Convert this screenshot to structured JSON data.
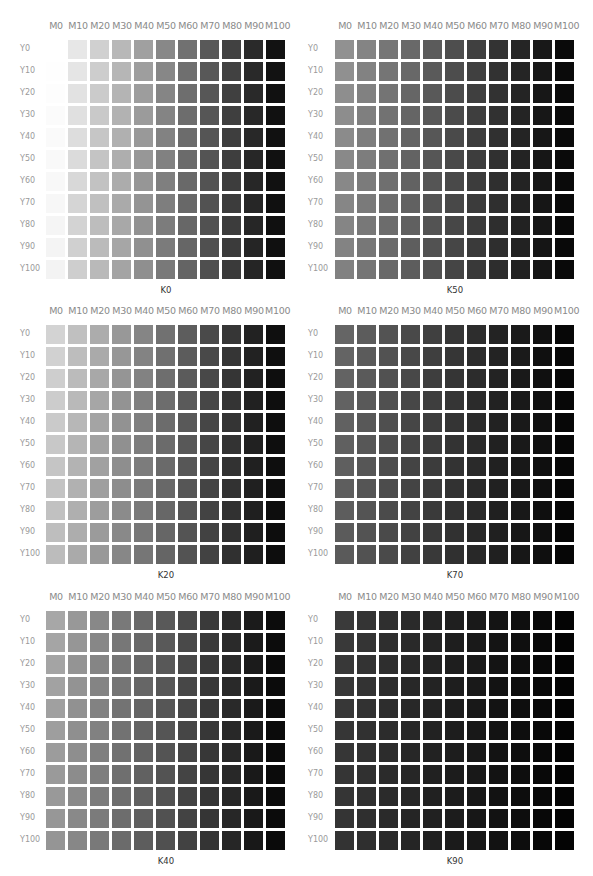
{
  "chart_data": {
    "type": "heatmap",
    "xlabel": "Magenta %",
    "ylabel": "Yellow %",
    "x_tick_labels": [
      "M0",
      "M10",
      "M20",
      "M30",
      "M40",
      "M50",
      "M60",
      "M70",
      "M80",
      "M90",
      "M100"
    ],
    "y_tick_labels": [
      "Y0",
      "Y10",
      "Y20",
      "Y30",
      "Y40",
      "Y50",
      "Y60",
      "Y70",
      "Y80",
      "Y90",
      "Y100"
    ],
    "panels": [
      {
        "label": "K0",
        "k": 0,
        "position": "top-left"
      },
      {
        "label": "K50",
        "k": 50,
        "position": "top-right"
      },
      {
        "label": "K20",
        "k": 20,
        "position": "middle-left"
      },
      {
        "label": "K70",
        "k": 70,
        "position": "middle-right"
      },
      {
        "label": "K40",
        "k": 40,
        "position": "bottom-left"
      },
      {
        "label": "K90",
        "k": 90,
        "position": "bottom-right"
      }
    ],
    "value_note": "Each cell shade = grayscale rendering of (M, Y, K); darkness increases with M strongly, Y slightly, K strongly",
    "legend": "none",
    "grid": false
  },
  "panels": [
    {
      "title": "K0",
      "x": 0,
      "y": 20,
      "k": 0
    },
    {
      "title": "K50",
      "x": 290,
      "y": 20,
      "k": 50
    },
    {
      "title": "K20",
      "x": 0,
      "y": 305,
      "k": 20
    },
    {
      "title": "K70",
      "x": 290,
      "y": 305,
      "k": 70
    },
    {
      "title": "K40",
      "x": 0,
      "y": 591,
      "k": 40
    },
    {
      "title": "K90",
      "x": 290,
      "y": 591,
      "k": 90
    }
  ],
  "columns": [
    "M0",
    "M10",
    "M20",
    "M30",
    "M40",
    "M50",
    "M60",
    "M70",
    "M80",
    "M90",
    "M100"
  ],
  "rows": [
    "Y0",
    "Y10",
    "Y20",
    "Y30",
    "Y40",
    "Y50",
    "Y60",
    "Y70",
    "Y80",
    "Y90",
    "Y100"
  ]
}
